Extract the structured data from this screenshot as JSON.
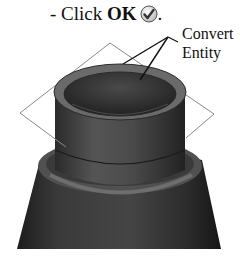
{
  "instruction": {
    "prefix": "- Click ",
    "bold": "OK",
    "suffix": ".",
    "icon": "ok-checkmark-icon"
  },
  "callout": {
    "line1": "Convert",
    "line2": "Entity"
  },
  "colors": {
    "body_dark": "#2e2e2e",
    "rim_gray": "#6a6a6a",
    "plane_line": "#8a8a8a"
  }
}
